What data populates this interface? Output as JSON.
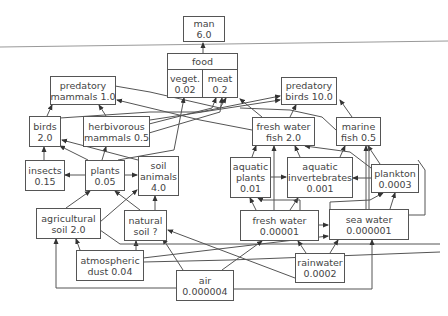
{
  "diagram": {
    "nodes": {
      "man": {
        "name": "man",
        "value": "6.0"
      },
      "food": {
        "name": "food",
        "veget": {
          "name": "veget.",
          "value": "0.02"
        },
        "meat": {
          "name": "meat",
          "value": "0.2"
        }
      },
      "predatory_mammals": {
        "line1": "predatory",
        "line2": "mammals 1.0"
      },
      "birds": {
        "line1": "birds",
        "line2": "2.0"
      },
      "herbivorous_mammals": {
        "line1": "herbivorous",
        "line2": "mammals 0.5"
      },
      "predatory_birds": {
        "line1": "predatory",
        "line2": "birds 10.0"
      },
      "fresh_water_fish": {
        "line1": "fresh water",
        "line2": "fish 2.0"
      },
      "marine_fish": {
        "line1": "marine",
        "line2": "fish 0.5"
      },
      "insects": {
        "line1": "insects",
        "line2": "0.15"
      },
      "plants": {
        "line1": "plants",
        "line2": "0.05"
      },
      "soil_animals": {
        "line1": "soil",
        "line2": "animals",
        "line3": "4.0"
      },
      "aquatic_plants": {
        "line1": "aquatic",
        "line2": "plants",
        "line3": "0.01"
      },
      "aquatic_invertebrates": {
        "line1": "aquatic",
        "line2": "invertebrates",
        "line3": "0.001"
      },
      "plankton": {
        "line1": "plankton",
        "line2": "0.0003"
      },
      "agricultural_soil": {
        "line1": "agricultural",
        "line2": "soil 2.0"
      },
      "natural_soil": {
        "line1": "natural",
        "line2": "soil ?"
      },
      "fresh_water": {
        "line1": "fresh water",
        "line2": "0.00001"
      },
      "sea_water": {
        "line1": "sea water",
        "line2": "0.000001"
      },
      "atmospheric_dust": {
        "line1": "atmospheric",
        "line2": "dust 0.04"
      },
      "rainwater": {
        "line1": "rainwater",
        "line2": "0.0002"
      },
      "air": {
        "line1": "air",
        "line2": "0.000004"
      }
    },
    "edges": [
      [
        "food",
        "man"
      ],
      [
        "predatory_mammals",
        "meat"
      ],
      [
        "birds",
        "predatory_mammals"
      ],
      [
        "herbivorous_mammals",
        "predatory_mammals"
      ],
      [
        "herbivorous_mammals",
        "meat"
      ],
      [
        "birds",
        "meat"
      ],
      [
        "fresh_water_fish",
        "predatory_mammals"
      ],
      [
        "fresh_water_fish",
        "predatory_birds"
      ],
      [
        "fresh_water_fish",
        "meat"
      ],
      [
        "marine_fish",
        "predatory_birds"
      ],
      [
        "insects",
        "birds"
      ],
      [
        "plants",
        "birds"
      ],
      [
        "plants",
        "insects"
      ],
      [
        "plants",
        "herbivorous_mammals"
      ],
      [
        "plants",
        "veget"
      ],
      [
        "plants",
        "soil_animals"
      ],
      [
        "soil_animals",
        "birds"
      ],
      [
        "aquatic_plants",
        "fresh_water_fish"
      ],
      [
        "aquatic_plants",
        "aquatic_invertebrates"
      ],
      [
        "aquatic_invertebrates",
        "fresh_water_fish"
      ],
      [
        "aquatic_invertebrates",
        "marine_fish"
      ],
      [
        "plankton",
        "aquatic_invertebrates"
      ],
      [
        "plankton",
        "marine_fish"
      ],
      [
        "agricultural_soil",
        "plants"
      ],
      [
        "agricultural_soil",
        "soil_animals"
      ],
      [
        "natural_soil",
        "plants"
      ],
      [
        "natural_soil",
        "soil_animals"
      ],
      [
        "fresh_water",
        "aquatic_plants"
      ],
      [
        "fresh_water",
        "fresh_water_fish"
      ],
      [
        "fresh_water",
        "aquatic_invertebrates"
      ],
      [
        "fresh_water",
        "sea_water"
      ],
      [
        "sea_water",
        "plankton"
      ],
      [
        "sea_water",
        "marine_fish"
      ],
      [
        "atmospheric_dust",
        "agricultural_soil"
      ],
      [
        "atmospheric_dust",
        "natural_soil"
      ],
      [
        "atmospheric_dust",
        "fresh_water"
      ],
      [
        "atmospheric_dust",
        "sea_water"
      ],
      [
        "rainwater",
        "fresh_water"
      ],
      [
        "rainwater",
        "sea_water"
      ],
      [
        "rainwater",
        "natural_soil"
      ],
      [
        "air",
        "agricultural_soil"
      ],
      [
        "air",
        "natural_soil"
      ],
      [
        "air",
        "sea_water"
      ],
      [
        "air",
        "plankton"
      ]
    ],
    "colors": {
      "line": "#555555",
      "text": "#444444",
      "background": "#ffffff"
    }
  }
}
